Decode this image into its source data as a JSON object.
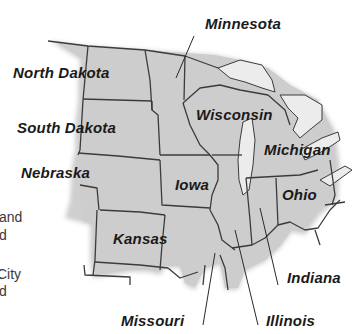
{
  "map": {
    "region": "Midwest United States",
    "colors": {
      "land": "#cfcfcf",
      "lake": "#ececec",
      "border": "#3b3b3b",
      "label": "#1a1a1a",
      "background": "#ffffff"
    },
    "states": [
      {
        "id": "minnesota",
        "label": "Minnesota"
      },
      {
        "id": "north-dakota",
        "label": "North Dakota"
      },
      {
        "id": "south-dakota",
        "label": "South Dakota"
      },
      {
        "id": "wisconsin",
        "label": "Wisconsin"
      },
      {
        "id": "michigan",
        "label": "Michigan"
      },
      {
        "id": "nebraska",
        "label": "Nebraska"
      },
      {
        "id": "iowa",
        "label": "Iowa"
      },
      {
        "id": "ohio",
        "label": "Ohio"
      },
      {
        "id": "kansas",
        "label": "Kansas"
      },
      {
        "id": "indiana",
        "label": "Indiana"
      },
      {
        "id": "missouri",
        "label": "Missouri"
      },
      {
        "id": "illinois",
        "label": "Illinois"
      }
    ]
  },
  "margin_text": {
    "lines": [
      "and",
      "d",
      "City",
      "d"
    ]
  }
}
